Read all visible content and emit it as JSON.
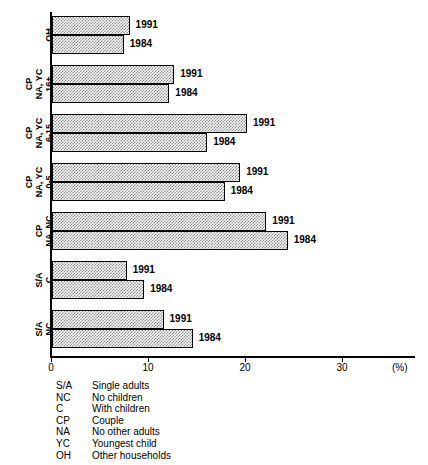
{
  "chart_data": {
    "type": "bar",
    "orientation": "horizontal",
    "title": "",
    "xlabel": "(%)",
    "ylabel": "",
    "xlim": [
      0,
      37.5
    ],
    "grid": false,
    "legend_position": "below-plot",
    "axis_unit": "(%)",
    "xticks": [
      {
        "value": 0,
        "label": "0"
      },
      {
        "value": 10,
        "label": "10"
      },
      {
        "value": 20,
        "label": "20"
      },
      {
        "value": 30,
        "label": "30"
      }
    ],
    "categories": [
      "OH",
      "CP NA, YC 16+",
      "CP NA, YC 6-15",
      "CP NA, YC 0-5",
      "CP NA, NC",
      "S/A C",
      "S/A NC"
    ],
    "series": [
      {
        "name": "1991",
        "values": [
          8.0,
          12.6,
          20.1,
          19.4,
          22.1,
          7.7,
          11.5
        ]
      },
      {
        "name": "1984",
        "values": [
          7.4,
          12.1,
          16.0,
          17.8,
          24.3,
          9.5,
          14.5
        ]
      }
    ]
  },
  "plot": {
    "groups": [
      {
        "label_lines": [
          "OH"
        ],
        "bars": [
          {
            "series": "1991",
            "value": 8.0,
            "label": "1991"
          },
          {
            "series": "1984",
            "value": 7.4,
            "label": "1984"
          }
        ]
      },
      {
        "label_lines": [
          "CP",
          "NA, YC",
          "16+"
        ],
        "bars": [
          {
            "series": "1991",
            "value": 12.6,
            "label": "1991"
          },
          {
            "series": "1984",
            "value": 12.1,
            "label": "1984"
          }
        ]
      },
      {
        "label_lines": [
          "CP",
          "NA, YC",
          "6-15"
        ],
        "bars": [
          {
            "series": "1991",
            "value": 20.1,
            "label": "1991"
          },
          {
            "series": "1984",
            "value": 16.0,
            "label": "1984"
          }
        ]
      },
      {
        "label_lines": [
          "CP",
          "NA, YC",
          "0-5"
        ],
        "bars": [
          {
            "series": "1991",
            "value": 19.4,
            "label": "1991"
          },
          {
            "series": "1984",
            "value": 17.8,
            "label": "1984"
          }
        ]
      },
      {
        "label_lines": [
          "CP",
          "NA, NC"
        ],
        "bars": [
          {
            "series": "1991",
            "value": 22.1,
            "label": "1991"
          },
          {
            "series": "1984",
            "value": 24.3,
            "label": "1984"
          }
        ]
      },
      {
        "label_lines": [
          "S/A",
          "C"
        ],
        "bars": [
          {
            "series": "1991",
            "value": 7.7,
            "label": "1991"
          },
          {
            "series": "1984",
            "value": 9.5,
            "label": "1984"
          }
        ]
      },
      {
        "label_lines": [
          "S/A",
          "NC"
        ],
        "bars": [
          {
            "series": "1991",
            "value": 11.5,
            "label": "1991"
          },
          {
            "series": "1984",
            "value": 14.5,
            "label": "1984"
          }
        ]
      }
    ]
  },
  "legend": {
    "rows": [
      {
        "abbr": "S/A",
        "desc": "Single adults"
      },
      {
        "abbr": "NC",
        "desc": "No children"
      },
      {
        "abbr": "C",
        "desc": "With children"
      },
      {
        "abbr": "CP",
        "desc": "Couple"
      },
      {
        "abbr": "NA",
        "desc": "No other adults"
      },
      {
        "abbr": "YC",
        "desc": "Youngest child"
      },
      {
        "abbr": "OH",
        "desc": "Other households"
      }
    ]
  },
  "style": {
    "bar_fill": "#8a8a8a",
    "bar_border": "#000000",
    "axis_color": "#000000",
    "background": "#ffffff"
  }
}
